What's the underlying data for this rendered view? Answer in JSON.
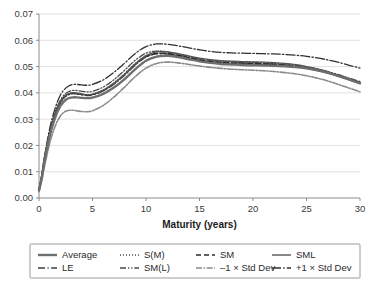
{
  "chart_data": {
    "type": "line",
    "title": "",
    "xlabel": "Maturity (years)",
    "ylabel": "",
    "xlim": [
      0,
      30
    ],
    "ylim": [
      0,
      0.07
    ],
    "grid": true,
    "legend_position": "bottom",
    "xticks": [
      "0",
      "5",
      "10",
      "15",
      "20",
      "25",
      "30"
    ],
    "xtick_values": [
      0,
      5,
      10,
      15,
      20,
      25,
      30
    ],
    "yticks": [
      "0.00",
      "0.01",
      "0.02",
      "0.03",
      "0.04",
      "0.05",
      "0.06",
      "0.07"
    ],
    "ytick_values": [
      0.0,
      0.01,
      0.02,
      0.03,
      0.04,
      0.05,
      0.06,
      0.07
    ],
    "x": [
      0,
      0.25,
      0.5,
      1,
      1.5,
      2,
      2.5,
      3,
      3.5,
      4,
      4.5,
      5,
      6,
      7,
      8,
      9,
      10,
      11,
      12,
      13,
      14,
      15,
      16,
      17,
      18,
      19,
      20,
      21,
      22,
      23,
      24,
      25,
      26,
      27,
      28,
      29,
      30
    ],
    "series": [
      {
        "name": "Average",
        "style": "solid-thick",
        "color": "#6e6e6e",
        "width": 2.4,
        "values": [
          0.003,
          0.0075,
          0.0135,
          0.0235,
          0.0305,
          0.035,
          0.0374,
          0.0382,
          0.0383,
          0.0381,
          0.038,
          0.0382,
          0.0396,
          0.042,
          0.0452,
          0.049,
          0.0522,
          0.0538,
          0.0541,
          0.0536,
          0.0528,
          0.052,
          0.0514,
          0.051,
          0.0508,
          0.0506,
          0.0505,
          0.0504,
          0.0503,
          0.0501,
          0.0498,
          0.0493,
          0.0486,
          0.0476,
          0.0464,
          0.045,
          0.0436
        ]
      },
      {
        "name": "S(M)",
        "style": "dotted",
        "color": "#4a4a4a",
        "width": 1.3,
        "values": [
          0.0028,
          0.0078,
          0.0142,
          0.0244,
          0.0316,
          0.0362,
          0.0386,
          0.0396,
          0.0397,
          0.0394,
          0.0392,
          0.0394,
          0.041,
          0.0438,
          0.0473,
          0.0512,
          0.0541,
          0.0551,
          0.0549,
          0.0541,
          0.0532,
          0.0524,
          0.0518,
          0.0514,
          0.0512,
          0.0511,
          0.051,
          0.0509,
          0.0507,
          0.0504,
          0.05,
          0.0494,
          0.0486,
          0.0476,
          0.0464,
          0.0451,
          0.0438
        ]
      },
      {
        "name": "SM",
        "style": "dashed",
        "color": "#2b2b2b",
        "width": 1.4,
        "values": [
          0.003,
          0.008,
          0.0145,
          0.0248,
          0.032,
          0.0366,
          0.039,
          0.0398,
          0.0398,
          0.0394,
          0.0392,
          0.0394,
          0.0409,
          0.0435,
          0.0469,
          0.0508,
          0.0538,
          0.055,
          0.055,
          0.0543,
          0.0534,
          0.0526,
          0.052,
          0.0516,
          0.0514,
          0.0513,
          0.0512,
          0.0511,
          0.0509,
          0.0506,
          0.0502,
          0.0496,
          0.0488,
          0.0478,
          0.0466,
          0.0452,
          0.0438
        ]
      },
      {
        "name": "SML",
        "style": "solid",
        "color": "#555555",
        "width": 1.4,
        "values": [
          0.0032,
          0.0082,
          0.0148,
          0.025,
          0.0322,
          0.0368,
          0.0392,
          0.04,
          0.04,
          0.0396,
          0.0393,
          0.0395,
          0.041,
          0.0436,
          0.047,
          0.051,
          0.0542,
          0.0556,
          0.0556,
          0.0549,
          0.054,
          0.0532,
          0.0526,
          0.0522,
          0.052,
          0.0519,
          0.0518,
          0.0517,
          0.0515,
          0.0512,
          0.0507,
          0.05,
          0.0491,
          0.048,
          0.0467,
          0.0453,
          0.0439
        ]
      },
      {
        "name": "LE",
        "style": "dash-dot",
        "color": "#3d3d3d",
        "width": 1.3,
        "values": [
          0.003,
          0.0079,
          0.0144,
          0.0246,
          0.0318,
          0.0364,
          0.0388,
          0.0396,
          0.0396,
          0.0392,
          0.039,
          0.0392,
          0.0407,
          0.0433,
          0.0467,
          0.0506,
          0.0536,
          0.0548,
          0.0547,
          0.054,
          0.0531,
          0.0523,
          0.0517,
          0.0513,
          0.0511,
          0.051,
          0.0509,
          0.0508,
          0.0506,
          0.0503,
          0.0499,
          0.0493,
          0.0485,
          0.0475,
          0.0463,
          0.045,
          0.0437
        ]
      },
      {
        "name": "SM(L)",
        "style": "dash-dot-dot",
        "color": "#4a4a4a",
        "width": 1.3,
        "values": [
          0.0031,
          0.0081,
          0.0147,
          0.025,
          0.0324,
          0.0372,
          0.0398,
          0.0408,
          0.0409,
          0.0406,
          0.0404,
          0.0406,
          0.0422,
          0.045,
          0.0486,
          0.0524,
          0.0551,
          0.0559,
          0.0556,
          0.0547,
          0.0537,
          0.0529,
          0.0523,
          0.0519,
          0.0517,
          0.0516,
          0.0515,
          0.0514,
          0.0512,
          0.0509,
          0.0505,
          0.0499,
          0.0491,
          0.0481,
          0.0469,
          0.0456,
          0.0443
        ]
      },
      {
        "name": "–1 × Std Dev",
        "style": "dash-dot-thick",
        "color": "#8a8a8a",
        "width": 1.6,
        "values": [
          0.0024,
          0.0064,
          0.0118,
          0.0208,
          0.0272,
          0.0312,
          0.033,
          0.0334,
          0.0332,
          0.0329,
          0.0328,
          0.0332,
          0.0352,
          0.0384,
          0.0422,
          0.0462,
          0.0494,
          0.0512,
          0.0517,
          0.0514,
          0.0508,
          0.0502,
          0.0497,
          0.0493,
          0.049,
          0.0488,
          0.0486,
          0.0484,
          0.0481,
          0.0477,
          0.0472,
          0.0465,
          0.0456,
          0.0445,
          0.0432,
          0.0418,
          0.0404
        ]
      },
      {
        "name": "+1 × Std Dev",
        "style": "dash-dot-long",
        "color": "#303030",
        "width": 1.3,
        "values": [
          0.0034,
          0.0088,
          0.0156,
          0.0264,
          0.034,
          0.0392,
          0.0418,
          0.043,
          0.0432,
          0.043,
          0.0429,
          0.0432,
          0.0449,
          0.0478,
          0.0513,
          0.055,
          0.0576,
          0.0586,
          0.0585,
          0.0579,
          0.0571,
          0.0564,
          0.0558,
          0.0554,
          0.0552,
          0.0551,
          0.055,
          0.0549,
          0.0548,
          0.0546,
          0.0543,
          0.0539,
          0.0533,
          0.0525,
          0.0516,
          0.0505,
          0.0494
        ]
      }
    ]
  },
  "legend": {
    "entries": [
      {
        "label": "Average",
        "style": "solid-thick",
        "color": "#6e6e6e"
      },
      {
        "label": "S(M)",
        "style": "dotted",
        "color": "#4a4a4a"
      },
      {
        "label": "SM",
        "style": "dashed",
        "color": "#2b2b2b"
      },
      {
        "label": "SML",
        "style": "solid",
        "color": "#555555"
      },
      {
        "label": "LE",
        "style": "dash-dot",
        "color": "#3d3d3d"
      },
      {
        "label": "SM(L)",
        "style": "dash-dot-dot",
        "color": "#4a4a4a"
      },
      {
        "label": "–1 × Std Dev",
        "style": "dash-dot-thick",
        "color": "#8a8a8a"
      },
      {
        "label": "+1 × Std Dev",
        "style": "dash-dot-long",
        "color": "#303030"
      }
    ]
  },
  "axis": {
    "x_title": "Maturity (years)"
  }
}
